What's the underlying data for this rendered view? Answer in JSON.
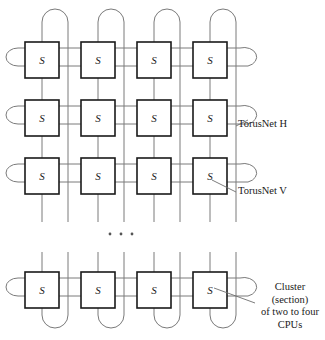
{
  "figure": {
    "type": "network-topology-diagram",
    "switch_label": "S",
    "ellipsis": "· · ·",
    "grid": {
      "columns": 4,
      "visible_rows": 4,
      "row_y": [
        42,
        100,
        158,
        272
      ],
      "column_x": [
        25,
        81,
        137,
        193
      ],
      "box_width": 34,
      "box_height": 36,
      "note_row_break_after": 3
    },
    "nodes": [
      {
        "row": 0,
        "col": 0,
        "label": "S"
      },
      {
        "row": 0,
        "col": 1,
        "label": "S"
      },
      {
        "row": 0,
        "col": 2,
        "label": "S"
      },
      {
        "row": 0,
        "col": 3,
        "label": "S"
      },
      {
        "row": 1,
        "col": 0,
        "label": "S"
      },
      {
        "row": 1,
        "col": 1,
        "label": "S"
      },
      {
        "row": 1,
        "col": 2,
        "label": "S"
      },
      {
        "row": 1,
        "col": 3,
        "label": "S"
      },
      {
        "row": 2,
        "col": 0,
        "label": "S"
      },
      {
        "row": 2,
        "col": 1,
        "label": "S"
      },
      {
        "row": 2,
        "col": 2,
        "label": "S"
      },
      {
        "row": 2,
        "col": 3,
        "label": "S"
      },
      {
        "row": 3,
        "col": 0,
        "label": "S"
      },
      {
        "row": 3,
        "col": 1,
        "label": "S"
      },
      {
        "row": 3,
        "col": 2,
        "label": "S"
      },
      {
        "row": 3,
        "col": 3,
        "label": "S"
      }
    ]
  },
  "annotations": {
    "torusnet_h": "TorusNet H",
    "torusnet_v": "TorusNet V",
    "cluster": {
      "line1": "Cluster",
      "line2": "(section)",
      "line3": "of two to four",
      "line4": "CPUs"
    }
  },
  "colors": {
    "background": "#ffffff",
    "wire": "#7a7a7a",
    "box_stroke": "#1a1a1a",
    "box_fill": "#ffffff",
    "text": "#1a1a1a"
  }
}
